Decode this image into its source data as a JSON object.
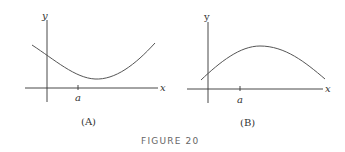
{
  "figure": {
    "caption": "FIGURE 20",
    "panels": [
      {
        "id": "A",
        "label": "(A)",
        "x_axis_label": "x",
        "y_axis_label": "y",
        "tick_label": "a",
        "curve": "concave-up, minimum to the right of a"
      },
      {
        "id": "B",
        "label": "(B)",
        "x_axis_label": "x",
        "y_axis_label": "y",
        "tick_label": "a",
        "curve": "concave-down, maximum to the right of a"
      }
    ]
  },
  "colors": {
    "axis": "#333333",
    "curve": "#555555",
    "caption": "#666666"
  }
}
